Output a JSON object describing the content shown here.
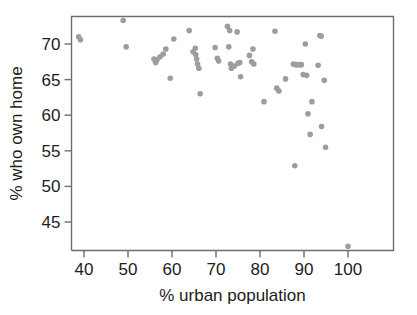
{
  "chart_data": {
    "type": "scatter",
    "title": "",
    "subtitle": "",
    "xlabel": "% urban population",
    "ylabel": "% who own home",
    "xlim": [
      37,
      102
    ],
    "ylim": [
      41,
      74.2
    ],
    "xticks": [
      40,
      50,
      60,
      70,
      80,
      90,
      100
    ],
    "yticks": [
      45,
      50,
      55,
      60,
      65,
      70
    ],
    "xtick_labels": [
      "40",
      "50",
      "60",
      "70",
      "80",
      "90",
      "100"
    ],
    "ytick_labels": [
      "45",
      "50",
      "55",
      "60",
      "65",
      "70"
    ],
    "grid": false,
    "legend": null,
    "marker_color": "#9d9d9d",
    "marker_size": 5.6,
    "axis_color": "#6e6e6e",
    "n_points": 60,
    "annotations": [],
    "points": [
      {
        "x": 38.8,
        "y": 71.0
      },
      {
        "x": 39.2,
        "y": 70.6
      },
      {
        "x": 48.9,
        "y": 73.3
      },
      {
        "x": 49.6,
        "y": 69.6
      },
      {
        "x": 55.9,
        "y": 67.9
      },
      {
        "x": 56.3,
        "y": 67.4
      },
      {
        "x": 56.6,
        "y": 67.8
      },
      {
        "x": 57.3,
        "y": 68.2
      },
      {
        "x": 58.0,
        "y": 68.6
      },
      {
        "x": 58.6,
        "y": 69.3
      },
      {
        "x": 59.6,
        "y": 65.2
      },
      {
        "x": 60.4,
        "y": 70.7
      },
      {
        "x": 63.9,
        "y": 71.9
      },
      {
        "x": 64.8,
        "y": 68.9
      },
      {
        "x": 65.3,
        "y": 69.4
      },
      {
        "x": 65.4,
        "y": 68.5
      },
      {
        "x": 65.6,
        "y": 67.9
      },
      {
        "x": 65.8,
        "y": 67.2
      },
      {
        "x": 66.1,
        "y": 66.6
      },
      {
        "x": 66.4,
        "y": 63.0
      },
      {
        "x": 69.8,
        "y": 69.5
      },
      {
        "x": 70.3,
        "y": 68.0
      },
      {
        "x": 70.6,
        "y": 67.6
      },
      {
        "x": 72.6,
        "y": 72.5
      },
      {
        "x": 73.1,
        "y": 71.9
      },
      {
        "x": 72.9,
        "y": 69.6
      },
      {
        "x": 73.3,
        "y": 67.2
      },
      {
        "x": 73.5,
        "y": 66.6
      },
      {
        "x": 74.2,
        "y": 66.9
      },
      {
        "x": 74.8,
        "y": 71.7
      },
      {
        "x": 75.0,
        "y": 67.3
      },
      {
        "x": 75.4,
        "y": 67.4
      },
      {
        "x": 75.6,
        "y": 65.4
      },
      {
        "x": 77.6,
        "y": 68.4
      },
      {
        "x": 78.1,
        "y": 67.5
      },
      {
        "x": 78.4,
        "y": 69.3
      },
      {
        "x": 78.6,
        "y": 67.2
      },
      {
        "x": 80.9,
        "y": 61.9
      },
      {
        "x": 83.4,
        "y": 71.8
      },
      {
        "x": 83.8,
        "y": 63.8
      },
      {
        "x": 84.3,
        "y": 63.4
      },
      {
        "x": 85.8,
        "y": 65.1
      },
      {
        "x": 87.6,
        "y": 67.2
      },
      {
        "x": 88.1,
        "y": 67.1
      },
      {
        "x": 88.6,
        "y": 67.1
      },
      {
        "x": 89.1,
        "y": 67.1
      },
      {
        "x": 89.4,
        "y": 67.1
      },
      {
        "x": 87.9,
        "y": 52.9
      },
      {
        "x": 89.8,
        "y": 65.7
      },
      {
        "x": 90.3,
        "y": 70.0
      },
      {
        "x": 90.6,
        "y": 65.6
      },
      {
        "x": 90.9,
        "y": 60.2
      },
      {
        "x": 91.4,
        "y": 57.3
      },
      {
        "x": 91.8,
        "y": 61.9
      },
      {
        "x": 93.2,
        "y": 67.0
      },
      {
        "x": 93.6,
        "y": 71.2
      },
      {
        "x": 93.9,
        "y": 71.1
      },
      {
        "x": 94.0,
        "y": 58.4
      },
      {
        "x": 94.6,
        "y": 64.9
      },
      {
        "x": 94.9,
        "y": 55.5
      },
      {
        "x": 100.0,
        "y": 41.6
      }
    ]
  }
}
